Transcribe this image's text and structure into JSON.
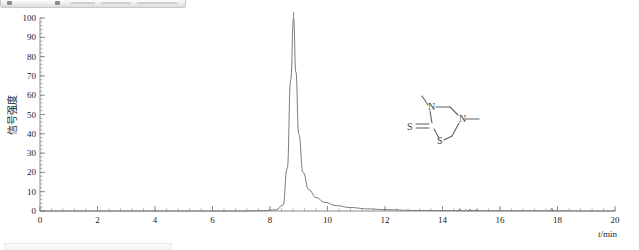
{
  "window": {
    "toolbar_top_name": "cropped-toolbar-strip",
    "toolbar_bottom_name": "cropped-statusbar-strip"
  },
  "chart_data": {
    "type": "line",
    "title": "",
    "xlabel": "t/min",
    "ylabel": "信号强度",
    "xlim": [
      0,
      20
    ],
    "ylim": [
      0,
      100
    ],
    "xticks": [
      0,
      2,
      4,
      6,
      8,
      10,
      12,
      14,
      16,
      18,
      20
    ],
    "xtick_labels": [
      "0",
      "2",
      "4",
      "6",
      "8",
      "10",
      "12",
      "14",
      "16",
      "18",
      "20"
    ],
    "yticks": [
      0,
      10,
      20,
      30,
      40,
      50,
      60,
      70,
      80,
      90,
      100
    ],
    "ytick_labels": [
      "0",
      "10",
      "20",
      "30",
      "40",
      "50",
      "60",
      "70",
      "80",
      "90",
      "100"
    ],
    "x_minor_interval": 0.4,
    "y_minor_interval": 2,
    "grid": false,
    "legend": false,
    "trace_color": "#7a7a7a",
    "annotations": [
      {
        "text": "8.82min",
        "x": 8.82,
        "y": 100,
        "name": "peak-retention-time-label"
      }
    ],
    "peaks": [
      {
        "retention_time": 8.82,
        "height": 100,
        "label": "8.82min",
        "tailing": true
      }
    ],
    "baseline_blips": [
      {
        "x": 14.6,
        "height": 1.2
      },
      {
        "x": 14.95,
        "height": 1.0
      },
      {
        "x": 15.2,
        "height": 0.9
      },
      {
        "x": 17.8,
        "height": 1.4
      }
    ],
    "series": [
      {
        "name": "chromatogram",
        "x": [
          0,
          1,
          2,
          3,
          4,
          5,
          6,
          7,
          7.8,
          8.2,
          8.45,
          8.6,
          8.72,
          8.82,
          8.9,
          9.0,
          9.15,
          9.35,
          9.6,
          9.9,
          10.3,
          10.8,
          11.4,
          12,
          13,
          14,
          15,
          16,
          17,
          18,
          19,
          20
        ],
        "y": [
          0,
          0,
          0,
          0,
          0,
          0,
          0,
          0,
          0.2,
          0.6,
          3,
          22,
          68,
          100,
          72,
          40,
          20,
          11,
          7,
          4.5,
          2.8,
          1.8,
          1.1,
          0.7,
          0.3,
          0.2,
          0.2,
          0.1,
          0.1,
          0.1,
          0,
          0
        ]
      }
    ]
  },
  "structure": {
    "name": "dazomet-skeletal-structure",
    "atoms": [
      {
        "label": "S",
        "role": "thione-sulfur"
      },
      {
        "label": "N",
        "role": "ring-nitrogen-3"
      },
      {
        "label": "N",
        "role": "ring-nitrogen-5"
      },
      {
        "label": "S",
        "role": "ring-sulfur"
      }
    ]
  }
}
